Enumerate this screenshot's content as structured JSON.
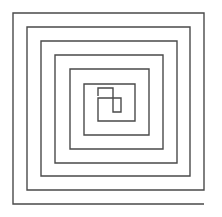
{
  "figure": {
    "kind": "line-drawing",
    "background_color": "#ffffff",
    "stroke_color": "#4a4a4a",
    "stroke_width": 1.4,
    "canvas": {
      "width": 222,
      "height": 217
    },
    "geometry": {
      "turns": 7,
      "ring_spacing": 14,
      "outer_bounds": {
        "left": 13,
        "top": 13,
        "right": 204,
        "bottom": 204
      },
      "center_terminus": {
        "x": 113,
        "y": 96
      },
      "winding": "clockwise-inward",
      "vertical_line_positions": [
        13,
        27,
        41,
        55,
        70,
        84,
        98,
        113,
        121,
        135,
        149,
        163,
        177,
        190,
        204
      ],
      "horizontal_line_positions": [
        13,
        27,
        41,
        55,
        69,
        88,
        112,
        126,
        140,
        155,
        176,
        190,
        204
      ],
      "path_d": "M 204 204 L 13 204 L 13 13 L 204 13 L 204 190 L 27 190 L 27 27 L 190 27 L 190 176 L 41 176 L 41 41 L 177 41 L 177 163 L 55 163 L 55 55 L 163 55 L 163 149 L 70 149 L 70 69 L 149 69 L 149 135 L 84 135 L 84 84 L 135 84 L 135 121 L 98 121 L 98 98 L 121 98 L 121 112 L 113 112 L 113 88 L 98 88 L 98 96"
    }
  }
}
